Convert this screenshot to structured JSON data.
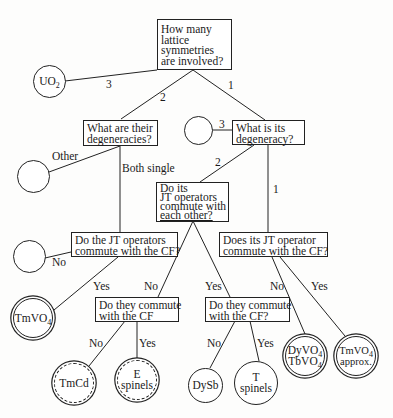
{
  "diagram": {
    "type": "decision-tree",
    "nodes": {
      "q_root": {
        "lines": [
          "How many",
          "lattice",
          "symmetries",
          "are involved?"
        ]
      },
      "q_degeneracies": {
        "lines": [
          "What are their",
          "degeneracies?"
        ]
      },
      "q_degeneracy": {
        "lines": [
          "What is its",
          "degeneracy?"
        ]
      },
      "q_commute_each_other": {
        "lines": [
          "Do its",
          "JT operators",
          "commute with",
          "each other?"
        ]
      },
      "q_jt_commute_cf": {
        "lines": [
          "Do the JT operators",
          "commute with the CF?"
        ]
      },
      "q_its_jt_commute_cf": {
        "lines": [
          "Does its JT operator",
          "commute with the CF?"
        ]
      },
      "q_they_commute_left": {
        "lines": [
          "Do they commute",
          "with the CF"
        ]
      },
      "q_they_commute_right": {
        "lines": [
          "Do they commute",
          "with the CF?"
        ]
      },
      "leaf_uo2": {
        "base": "UO",
        "sub": "2"
      },
      "leaf_other": {
        "label": ""
      },
      "leaf_three": {
        "label": ""
      },
      "leaf_no": {
        "label": ""
      },
      "leaf_tmvo4": {
        "base": "TmVO",
        "sub": "4"
      },
      "leaf_tmcd": {
        "label": "TmCd"
      },
      "leaf_e_spinels": {
        "lines": [
          "E",
          "spinels"
        ]
      },
      "leaf_dysb": {
        "label": "DySb"
      },
      "leaf_t_spinels": {
        "lines": [
          "T",
          "spinels"
        ]
      },
      "leaf_dyvo4_tbvo4": {
        "line1_base": "DyVO",
        "line1_sub": "4",
        "line2_base": "TbVO",
        "line2_sub": "4"
      },
      "leaf_tmvo4_approx": {
        "line1_base": "TmVO",
        "line1_sub": "4",
        "line2": "approx."
      }
    },
    "edge_labels": {
      "root_3": "3",
      "root_2": "2",
      "root_1": "1",
      "degeneracy_3": "3",
      "degeneracy_2": "2",
      "degeneracy_1": "1",
      "degeneracies_other": "Other",
      "degeneracies_both_single": "Both single",
      "jt_cf_no": "No",
      "jt_cf_yes": "Yes",
      "each_other_no": "No",
      "each_other_yes": "Yes",
      "its_jt_no": "No",
      "its_jt_yes": "Yes",
      "left_no": "No",
      "left_yes": "Yes",
      "right_no": "No",
      "right_yes": "Yes"
    },
    "colors": {
      "line": "#222222",
      "background": "#fdfdfc",
      "text": "#1a1a1a"
    }
  }
}
